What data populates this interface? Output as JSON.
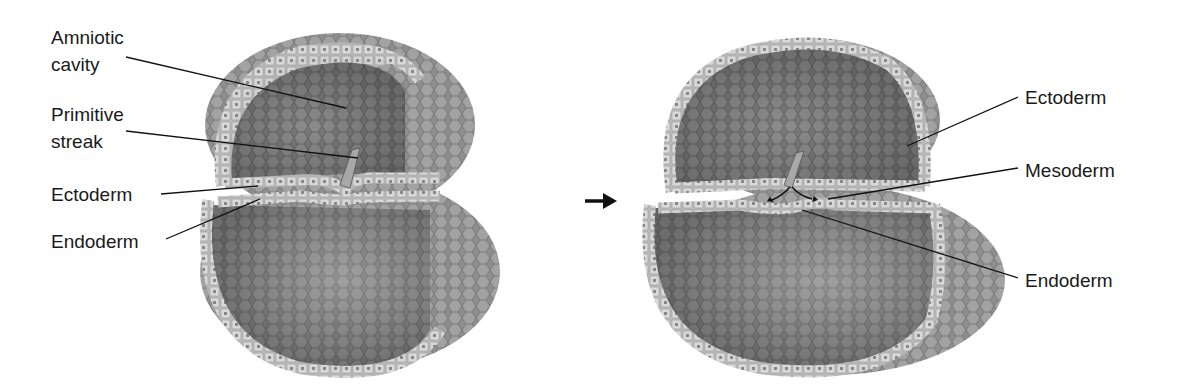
{
  "figure": {
    "left_panel": {
      "labels": [
        {
          "id": "amniotic-cavity",
          "lines": [
            "Amniotic",
            "cavity"
          ]
        },
        {
          "id": "primitive-streak",
          "lines": [
            "Primitive",
            "streak"
          ]
        },
        {
          "id": "ectoderm",
          "lines": [
            "Ectoderm"
          ]
        },
        {
          "id": "endoderm",
          "lines": [
            "Endoderm"
          ]
        }
      ]
    },
    "transition_arrow": "→",
    "right_panel": {
      "labels": [
        {
          "id": "ectoderm",
          "lines": [
            "Ectoderm"
          ]
        },
        {
          "id": "mesoderm",
          "lines": [
            "Mesoderm"
          ]
        },
        {
          "id": "endoderm",
          "lines": [
            "Endoderm"
          ]
        }
      ]
    },
    "colors": {
      "outer_surface": "#8a8a8a",
      "cell_layer": "#c8c8c8",
      "cavity_inner": "#6e6e6e",
      "text": "#1a1a1a"
    }
  }
}
